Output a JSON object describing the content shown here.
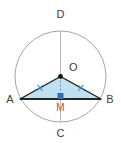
{
  "figure": {
    "labels": {
      "top": "D",
      "center": "O",
      "left": "A",
      "right": "B",
      "bottom": "C",
      "midpoint": "M"
    },
    "colors": {
      "circle_stroke": "#9a9a9a",
      "diameter_stroke": "#b5b5b5",
      "triangle_fill": "#bfe1f0",
      "triangle_stroke": "#1a1a1a",
      "chord_stroke": "#1a1a1a",
      "tick_mark": "#3a7fc4",
      "midpoint_marker": "#2f6fb5",
      "midpoint_label": "#d4482a",
      "point_dot": "#111111",
      "background": "#ffffff"
    }
  },
  "chart_data": {
    "type": "scatter",
    "xlabel": "",
    "ylabel": "",
    "xlim": [
      0,
      121
    ],
    "ylim": [
      143,
      0
    ],
    "grid": false,
    "legend": "none",
    "circle": {
      "center_x": 60.5,
      "center_y": 76.5,
      "radius": 45.5,
      "stroke": "#9a9a9a",
      "fill": "none"
    },
    "points": [
      {
        "name": "D",
        "x": 60.5,
        "y": 31.0,
        "label": "D",
        "label_x": 60.5,
        "label_y": 18.0,
        "dot": false
      },
      {
        "name": "O",
        "x": 60.5,
        "y": 76.5,
        "label": "O",
        "label_x": 69.0,
        "label_y": 71.0,
        "dot": true
      },
      {
        "name": "A",
        "x": 20.0,
        "y": 99.0,
        "label": "A",
        "label_x": 10.0,
        "label_y": 103.0,
        "dot": false
      },
      {
        "name": "B",
        "x": 101.0,
        "y": 99.0,
        "label": "B",
        "label_x": 110.0,
        "label_y": 103.0,
        "dot": false
      },
      {
        "name": "C",
        "x": 60.5,
        "y": 122.0,
        "label": "C",
        "label_x": 60.5,
        "label_y": 137.0,
        "dot": false
      },
      {
        "name": "M",
        "x": 60.5,
        "y": 99.0,
        "label": "M",
        "label_x": 60.5,
        "label_y": 111.0,
        "dot": false
      }
    ],
    "segments": [
      {
        "name": "diameter-DC",
        "from": "D",
        "to": "C",
        "x1": 60.5,
        "y1": 31.0,
        "x2": 60.5,
        "y2": 122.0,
        "stroke": "#b5b5b5",
        "dashed": false
      },
      {
        "name": "chord-AB",
        "from": "A",
        "to": "B",
        "x1": 20.0,
        "y1": 99.0,
        "x2": 101.0,
        "y2": 99.0,
        "stroke": "#1a1a1a",
        "dashed": false
      },
      {
        "name": "radius-OA",
        "from": "O",
        "to": "A",
        "x1": 60.5,
        "y1": 76.5,
        "x2": 20.0,
        "y2": 99.0,
        "stroke": "#1a1a1a",
        "dashed": false
      },
      {
        "name": "radius-OB",
        "from": "O",
        "to": "B",
        "x1": 60.5,
        "y1": 76.5,
        "x2": 101.0,
        "y2": 99.0,
        "stroke": "#1a1a1a",
        "dashed": false
      },
      {
        "name": "altitude-OM",
        "from": "O",
        "to": "M",
        "x1": 60.5,
        "y1": 76.5,
        "x2": 60.5,
        "y2": 99.0,
        "stroke": "#6f94b5",
        "dashed": true
      }
    ],
    "polygon": {
      "name": "triangle-AOB",
      "vertices": [
        [
          60.5,
          76.5
        ],
        [
          20.0,
          99.0
        ],
        [
          101.0,
          99.0
        ]
      ],
      "fill": "#bfe1f0",
      "stroke": "#1a1a1a"
    },
    "tick_marks": [
      {
        "name": "tick-OA",
        "x": 40.0,
        "y": 87.8,
        "angle": -29.1,
        "color": "#3a7fc4"
      },
      {
        "name": "tick-OB",
        "x": 81.0,
        "y": 87.8,
        "angle": 29.1,
        "color": "#3a7fc4"
      }
    ],
    "markers": [
      {
        "name": "midpoint-square-M",
        "x": 60.5,
        "y": 96.0,
        "size": 6,
        "color": "#2f6fb5",
        "shape": "square"
      }
    ]
  }
}
